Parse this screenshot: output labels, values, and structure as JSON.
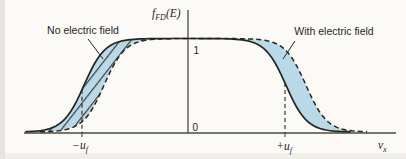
{
  "labels": {
    "no_field": "No electric field",
    "with_field": "With electric field"
  },
  "axis": {
    "y_title": {
      "base": "f",
      "sub": "FD",
      "rest": "(E)"
    },
    "x_title": {
      "base": "v",
      "sub": "x"
    },
    "tick_one": "1",
    "tick_zero": "0",
    "neg_uf": {
      "sign": "−",
      "base": "u",
      "sub": "f"
    },
    "pos_uf": {
      "sign": "+",
      "base": "u",
      "sub": "f"
    }
  },
  "colors": {
    "paper": "#fbfaf7",
    "fill": "#b9d9e8",
    "curve": "#26261f",
    "axis": "#4a4a44",
    "hatch": "#3a3a33",
    "text": "#26261f"
  },
  "chart_data": {
    "type": "line",
    "xlabel": "v_x",
    "ylabel": "f_FD(E)",
    "y_ticks": [
      0,
      1
    ],
    "x_tick_labels": [
      "−u_f",
      "+u_f"
    ],
    "ylim": [
      0,
      1
    ],
    "series": [
      {
        "name": "No electric field",
        "style": "solid",
        "shape": "plateau at f=1 between −u_f and +u_f with smooth Fermi roll-off to 0 centered at ±u_f"
      },
      {
        "name": "With electric field",
        "style": "dashed",
        "shape": "same distribution rigidly shifted toward +v_x by about 0.25·u_f"
      }
    ],
    "shaded_regions": [
      {
        "location": "around −u_f",
        "style": "blue with diagonal hatching",
        "meaning": "difference between the two curves"
      },
      {
        "location": "around +u_f",
        "style": "solid light blue",
        "meaning": "difference between the two curves"
      }
    ]
  },
  "geometry": {
    "top_y": 38.5,
    "bottom_y": 132,
    "axis_y": 133,
    "slope": 10.5,
    "solid_c1": 84,
    "solid_c2": 286,
    "dashed_c1": 104,
    "dashed_c2": 306,
    "solid_x": [
      26,
      352
    ],
    "dashed_x": [
      40,
      368
    ],
    "band_x": [
      26,
      368
    ],
    "marker_left": 82,
    "marker_right": 285
  }
}
